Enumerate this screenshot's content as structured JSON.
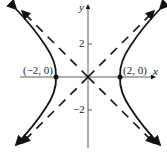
{
  "diagram": {
    "type": "hyperbola graph",
    "equation_shape": "x^2/4 - y^2/4 = 1",
    "axes": {
      "x_label": "x",
      "y_label": "y"
    },
    "ticks": {
      "y_pos": "2",
      "y_neg": "−2"
    },
    "vertices": [
      {
        "label": "(−2, 0)"
      },
      {
        "label": "(2, 0)"
      }
    ],
    "asymptotes": "dashed lines y = ±x",
    "colors": {
      "curve": "#111111",
      "axis": "#333333"
    }
  }
}
